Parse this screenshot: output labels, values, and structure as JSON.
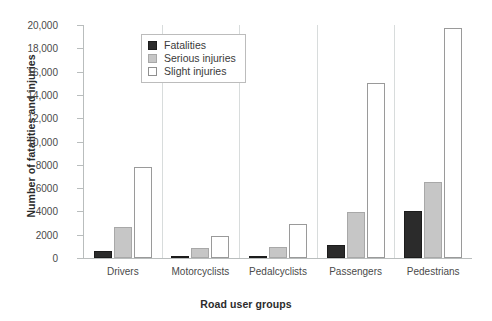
{
  "chart_data": {
    "type": "bar",
    "title": "",
    "xlabel": "Road user groups",
    "ylabel": "Number of fatalities and injuries",
    "categories": [
      "Drivers",
      "Motorcyclists",
      "Pedalcyclists",
      "Passengers",
      "Pedestrians"
    ],
    "series": [
      {
        "name": "Fatalities",
        "color": "#2b2b2b",
        "values": [
          620,
          180,
          140,
          1120,
          4030
        ]
      },
      {
        "name": "Serious injuries",
        "color": "#c6c6c6",
        "values": [
          2660,
          860,
          940,
          3950,
          6520
        ]
      },
      {
        "name": "Slight injuries",
        "color": "#ffffff",
        "values": [
          7810,
          1890,
          2920,
          15020,
          19740
        ]
      }
    ],
    "ylim": [
      0,
      20000
    ],
    "yticks": [
      0,
      2000,
      4000,
      6000,
      8000,
      10000,
      12000,
      14000,
      16000,
      18000,
      20000
    ],
    "ytick_labels": [
      "0",
      "2000",
      "4000",
      "6000",
      "8000",
      "10,000",
      "12,000",
      "14,000",
      "16,000",
      "18,000",
      "20,000"
    ],
    "grid": false,
    "legend_position": "upper-left-inside"
  },
  "legend": {
    "entries": [
      {
        "label": "Fatalities",
        "swatch": "fatalities-swatch"
      },
      {
        "label": "Serious injuries",
        "swatch": "serious-injuries-swatch"
      },
      {
        "label": "Slight injuries",
        "swatch": "slight-injuries-swatch"
      }
    ]
  }
}
